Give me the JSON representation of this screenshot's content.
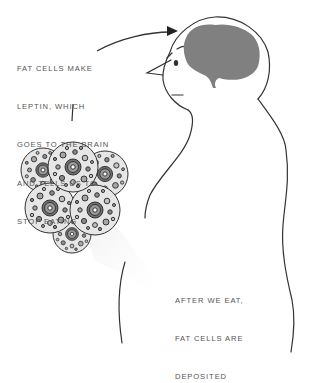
{
  "annotations": {
    "leptin": {
      "lines": [
        "FAT CELLS MAKE",
        "LEPTIN, WHICH",
        "GOES TO THE BRAIN",
        "AND TELLS US TO",
        "STOP EATING"
      ]
    },
    "deposit": {
      "lines": [
        "AFTER WE EAT,",
        "FAT CELLS ARE",
        "DEPOSITED"
      ]
    }
  },
  "figure": {
    "highlight": "brain",
    "cluster": "fat-cell-cluster",
    "colors": {
      "outline": "#333333",
      "brain": "#808080",
      "text": "#555555",
      "cell_fill": "#e6e6e6",
      "cell_dots": [
        "#8a8a8a",
        "#a5a5a5",
        "#c0c0c0"
      ],
      "cone": "#f3f3f3"
    }
  }
}
